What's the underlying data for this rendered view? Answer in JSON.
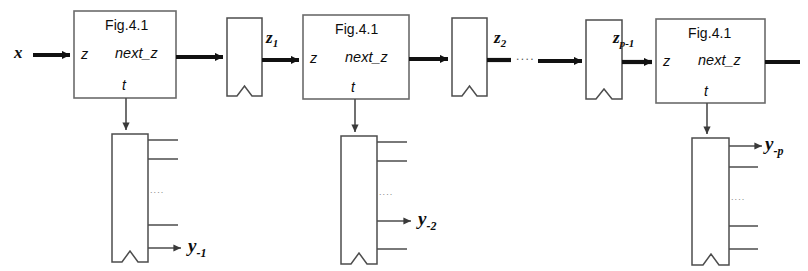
{
  "figure": {
    "canvas": {
      "width": 808,
      "height": 271
    },
    "stroke_color": "#111111",
    "fill_color": "#ffffff",
    "background": "#ffffff"
  },
  "blocks": [
    {
      "id": "stage-1",
      "caption": "Fig.4.1",
      "ports": {
        "input": "z",
        "output": "next_z",
        "time": "t"
      },
      "rect": {
        "x": 74,
        "y": 11,
        "w": 102,
        "h": 87
      }
    },
    {
      "id": "stage-2",
      "caption": "Fig.4.1",
      "ports": {
        "input": "z",
        "output": "next_z",
        "time": "t"
      },
      "rect": {
        "x": 303,
        "y": 15,
        "w": 106,
        "h": 84
      }
    },
    {
      "id": "stage-p",
      "caption": "Fig.4.1",
      "ports": {
        "input": "z",
        "output": "next_z",
        "time": "t"
      },
      "rect": {
        "x": 656,
        "y": 19,
        "w": 109,
        "h": 84
      }
    }
  ],
  "state_registers": [
    {
      "id": "state-reg-1",
      "rect": {
        "x": 227,
        "y": 18,
        "w": 35,
        "h": 78
      }
    },
    {
      "id": "state-reg-2",
      "rect": {
        "x": 452,
        "y": 18,
        "w": 35,
        "h": 78
      }
    },
    {
      "id": "state-reg-p",
      "rect": {
        "x": 586,
        "y": 20,
        "w": 36,
        "h": 79
      }
    }
  ],
  "output_registers": [
    {
      "id": "output-reg-1",
      "rect": {
        "x": 112,
        "y": 134,
        "w": 36,
        "h": 128
      },
      "tap_rows": [
        140,
        159,
        225,
        248
      ],
      "ellipsis_y": 193,
      "arrow_row_index": 3
    },
    {
      "id": "output-reg-2",
      "rect": {
        "x": 341,
        "y": 136,
        "w": 36,
        "h": 128
      },
      "tap_rows": [
        142,
        161,
        221,
        249
      ],
      "ellipsis_y": 195,
      "arrow_row_index": 2
    },
    {
      "id": "output-reg-p",
      "rect": {
        "x": 692,
        "y": 138,
        "w": 37,
        "h": 127
      },
      "tap_rows": [
        146,
        167,
        226,
        249
      ],
      "ellipsis_y": 200,
      "arrow_row_index": 0
    }
  ],
  "signals": [
    {
      "id": "input-x",
      "base": "x",
      "sub": "",
      "x": 14,
      "y": 44
    },
    {
      "id": "state-z1",
      "base": "z",
      "sub": "1",
      "x": 266,
      "y": 29
    },
    {
      "id": "state-z2",
      "base": "z",
      "sub": "2",
      "x": 494,
      "y": 29
    },
    {
      "id": "state-zp1",
      "base": "z",
      "sub": "p-1",
      "x": 613,
      "y": 29
    },
    {
      "id": "output-y1",
      "base": "y",
      "sub": "-1",
      "x": 188,
      "y": 238
    },
    {
      "id": "output-y2",
      "base": "y",
      "sub": "-2",
      "x": 418,
      "y": 211
    },
    {
      "id": "output-yp",
      "base": "y",
      "sub": "-p",
      "x": 765,
      "y": 136
    }
  ],
  "ellipses": [
    {
      "id": "chain-ellipsis",
      "text": "....",
      "x": 516,
      "y": 54,
      "orientation": "horizontal"
    }
  ],
  "labels": {
    "caption": "Fig.4.1",
    "port_in": "z",
    "port_out": "next_z",
    "port_time": "t",
    "vertical_ellipsis": "...."
  }
}
